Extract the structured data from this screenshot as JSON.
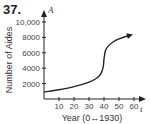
{
  "problem_number": "37.",
  "chart_data": {
    "type": "line",
    "title": "",
    "xlabel": "Year (0↔1930)",
    "ylabel": "Number of Aides",
    "x_var": "t",
    "y_var": "A",
    "xlim": [
      0,
      65
    ],
    "ylim": [
      0,
      10500
    ],
    "x_ticks": [
      10,
      20,
      30,
      40,
      50,
      60
    ],
    "y_ticks": [
      2000,
      4000,
      6000,
      8000,
      10000
    ],
    "y_tick_labels": [
      "2000",
      "4000",
      "6000",
      "8000",
      "10,000"
    ],
    "grid": false,
    "legend": null,
    "series": [
      {
        "name": "A(t)",
        "x": [
          0,
          10,
          20,
          30,
          35,
          38,
          39.5,
          40,
          41,
          43,
          46,
          50,
          55,
          58
        ],
        "values": [
          900,
          1200,
          1600,
          2200,
          2700,
          3300,
          4200,
          5200,
          6300,
          6900,
          7400,
          7800,
          8150,
          8300
        ],
        "end_arrow": true
      }
    ]
  }
}
